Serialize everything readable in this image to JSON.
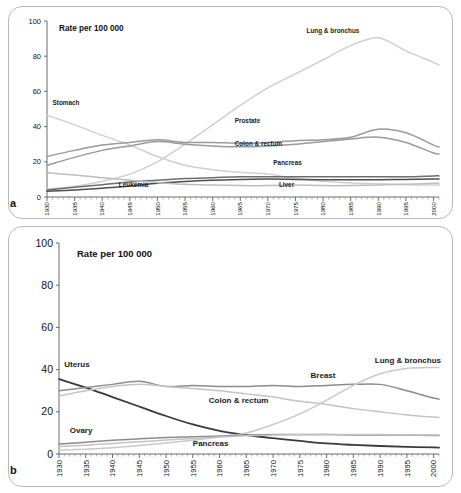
{
  "figure": {
    "background": "#ffffff",
    "panel_border_color": "#b8b8b8"
  },
  "panels": [
    {
      "letter": "a",
      "axis_title": "Rate per 100 000"
    },
    {
      "letter": "b",
      "axis_title": "Rate per 100 000"
    }
  ],
  "chart_data": [
    {
      "type": "line",
      "panel": "a",
      "title": "",
      "subtitle": "",
      "xlabel": "",
      "ylabel": "Rate per 100 000",
      "axis_title_in_plot": "Rate per 100 000",
      "grid": false,
      "legend_position": "inline-labels",
      "xlim": [
        1930,
        2001
      ],
      "ylim": [
        0,
        100
      ],
      "yticks": [
        0,
        20,
        40,
        60,
        80,
        100
      ],
      "xticks": [
        1930,
        1935,
        1940,
        1945,
        1950,
        1955,
        1960,
        1965,
        1970,
        1975,
        1980,
        1985,
        1990,
        1995,
        2000
      ],
      "x": [
        1930,
        1935,
        1940,
        1945,
        1950,
        1955,
        1960,
        1965,
        1970,
        1975,
        1980,
        1985,
        1990,
        1995,
        2000,
        2001
      ],
      "series": [
        {
          "name": "Lung & bronchus",
          "color": "#cfcfcf",
          "width": 1.5,
          "label_x": 1977,
          "label_y": 93,
          "values": [
            4.5,
            6.0,
            9.0,
            13.0,
            20.0,
            30.0,
            41.0,
            52.0,
            62.0,
            70.0,
            78.0,
            86.0,
            90.5,
            83.0,
            76.5,
            75.0
          ]
        },
        {
          "name": "Stomach",
          "color": "#cfcfcf",
          "width": 1.5,
          "label_x": 1931,
          "label_y": 52,
          "values": [
            46.5,
            41.0,
            35.0,
            29.5,
            23.0,
            18.0,
            15.5,
            14.0,
            13.0,
            10.5,
            9.0,
            8.0,
            7.5,
            7.0,
            6.8,
            6.8
          ]
        },
        {
          "name": "Prostate",
          "color": "#9a9a9a",
          "width": 1.5,
          "label_x": 1964,
          "label_y": 42,
          "values": [
            23.0,
            26.5,
            29.5,
            31.0,
            32.5,
            31.0,
            31.0,
            30.5,
            31.0,
            32.0,
            32.5,
            34.0,
            38.5,
            36.5,
            29.5,
            28.5
          ]
        },
        {
          "name": "Colon & rectum",
          "color": "#9a9a9a",
          "width": 1.5,
          "label_x": 1964,
          "label_y": 29,
          "values": [
            18.0,
            22.5,
            26.5,
            29.0,
            31.5,
            30.0,
            29.0,
            28.5,
            29.0,
            30.0,
            31.5,
            33.0,
            34.0,
            31.0,
            25.0,
            24.5
          ]
        },
        {
          "name": "Pancreas",
          "color": "#6e6e6e",
          "width": 1.5,
          "label_x": 1971,
          "label_y": 18,
          "values": [
            4.0,
            5.5,
            7.0,
            8.5,
            9.5,
            10.5,
            11.0,
            11.5,
            11.5,
            11.5,
            11.5,
            11.5,
            11.5,
            11.5,
            12.0,
            12.0
          ]
        },
        {
          "name": "Leukemia",
          "color": "#4d4d4d",
          "width": 1.5,
          "label_x": 1943,
          "label_y": 5.5,
          "values": [
            3.3,
            4.0,
            5.0,
            6.2,
            7.8,
            8.8,
            9.5,
            10.0,
            10.2,
            10.0,
            9.8,
            9.8,
            9.8,
            10.0,
            10.2,
            10.2
          ]
        },
        {
          "name": "Liver",
          "color": "#bdbdbd",
          "width": 1.5,
          "label_x": 1972,
          "label_y": 5.5,
          "values": [
            13.8,
            12.5,
            11.0,
            9.5,
            8.2,
            7.2,
            6.8,
            6.5,
            6.5,
            6.8,
            6.5,
            6.5,
            6.8,
            7.2,
            7.8,
            8.0
          ]
        }
      ]
    },
    {
      "type": "line",
      "panel": "b",
      "title": "",
      "subtitle": "",
      "xlabel": "",
      "ylabel": "Rate per 100 000",
      "axis_title_in_plot": "Rate per 100 000",
      "grid": false,
      "legend_position": "inline-labels",
      "xlim": [
        1930,
        2001
      ],
      "ylim": [
        0,
        100
      ],
      "yticks": [
        0,
        20,
        40,
        60,
        80,
        100
      ],
      "xticks": [
        1930,
        1935,
        1940,
        1945,
        1950,
        1955,
        1960,
        1965,
        1970,
        1975,
        1980,
        1985,
        1990,
        1995,
        2000
      ],
      "x": [
        1930,
        1935,
        1940,
        1945,
        1950,
        1955,
        1960,
        1965,
        1970,
        1975,
        1980,
        1985,
        1990,
        1995,
        2000,
        2001
      ],
      "series": [
        {
          "name": "Uterus",
          "color": "#3a3a3a",
          "width": 1.8,
          "label_x": 1931,
          "label_y": 41,
          "values": [
            35.5,
            31.5,
            27.0,
            22.5,
            18.0,
            14.0,
            11.0,
            9.0,
            7.5,
            6.2,
            5.0,
            4.3,
            3.8,
            3.4,
            3.1,
            3.0
          ]
        },
        {
          "name": "Breast",
          "color": "#8c8c8c",
          "width": 1.5,
          "label_x": 1977,
          "label_y": 36,
          "values": [
            30.0,
            31.5,
            33.0,
            34.5,
            32.0,
            32.5,
            32.0,
            32.0,
            32.5,
            32.0,
            32.5,
            33.0,
            33.0,
            30.0,
            26.5,
            26.0
          ]
        },
        {
          "name": "Colon & rectum",
          "color": "#c3c3c3",
          "width": 1.5,
          "label_x": 1958,
          "label_y": 24,
          "values": [
            27.5,
            30.0,
            32.0,
            33.0,
            32.0,
            31.0,
            30.0,
            28.5,
            27.0,
            25.0,
            23.5,
            21.5,
            20.0,
            18.5,
            17.5,
            17.3
          ]
        },
        {
          "name": "Lung & bronchus",
          "color": "#c9c9c9",
          "width": 1.5,
          "label_x": 1989,
          "label_y": 43,
          "values": [
            1.8,
            2.3,
            3.0,
            4.0,
            5.2,
            6.5,
            8.0,
            10.0,
            14.0,
            19.0,
            25.5,
            32.5,
            38.0,
            40.5,
            41.0,
            41.0
          ]
        },
        {
          "name": "Ovary",
          "color": "#8c8c8c",
          "width": 1.5,
          "label_x": 1932,
          "label_y": 10,
          "values": [
            4.7,
            5.6,
            6.5,
            7.2,
            7.8,
            8.2,
            8.5,
            9.0,
            9.2,
            9.2,
            9.2,
            9.0,
            9.0,
            9.0,
            8.8,
            8.8
          ]
        },
        {
          "name": "Pancreas",
          "color": "#c3c3c3",
          "width": 1.5,
          "label_x": 1955,
          "label_y": 4,
          "values": [
            3.5,
            4.2,
            5.0,
            5.8,
            6.6,
            7.3,
            8.0,
            8.6,
            9.0,
            9.1,
            9.2,
            9.2,
            9.2,
            9.1,
            9.0,
            9.0
          ]
        }
      ]
    }
  ]
}
